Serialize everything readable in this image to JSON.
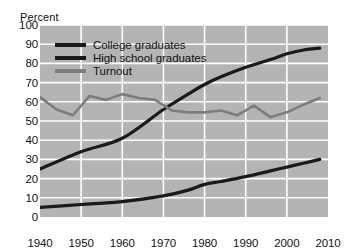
{
  "chart_data": {
    "type": "line",
    "title": "",
    "subtitle": "",
    "xlabel": "",
    "ylabel": "Percent",
    "xlim": [
      1940,
      2010
    ],
    "ylim": [
      0,
      100
    ],
    "grid": true,
    "legend_position": "upper-left-inside",
    "xticks": [
      1940,
      1950,
      1960,
      1970,
      1980,
      1990,
      2000,
      2010
    ],
    "yticks": [
      0,
      10,
      20,
      30,
      40,
      50,
      60,
      70,
      80,
      90,
      100
    ],
    "xtick_labels": [
      "1940",
      "1950",
      "1960",
      "1970",
      "1980",
      "1990",
      "2000",
      "2010"
    ],
    "ytick_labels": [
      "0",
      "10",
      "20",
      "30",
      "40",
      "50",
      "60",
      "70",
      "80",
      "90",
      "100"
    ],
    "plot_background": "#b4b4b4",
    "gridline_color": "#ffffff",
    "series": [
      {
        "name": "College graduates",
        "color": "#1a1a1a",
        "x": [
          1940,
          1950,
          1960,
          1970,
          1976,
          1980,
          1984,
          1990,
          1996,
          2000,
          2004,
          2008
        ],
        "values": [
          5,
          6.5,
          8,
          11,
          14,
          17,
          18.5,
          21,
          24,
          26,
          28,
          30
        ]
      },
      {
        "name": "High school graduates",
        "color": "#1a1a1a",
        "x": [
          1940,
          1950,
          1960,
          1970,
          1976,
          1980,
          1984,
          1990,
          1996,
          2000,
          2004,
          2008
        ],
        "values": [
          25,
          34,
          41,
          56,
          64,
          69,
          73,
          78,
          82,
          85,
          87,
          88
        ]
      },
      {
        "name": "Turnout",
        "color": "#7d7d7d",
        "x": [
          1940,
          1944,
          1948,
          1952,
          1956,
          1960,
          1964,
          1968,
          1972,
          1976,
          1980,
          1984,
          1988,
          1992,
          1996,
          2000,
          2004,
          2008
        ],
        "values": [
          62.5,
          56,
          53,
          63,
          61,
          64,
          62,
          61,
          55.5,
          54.5,
          54.5,
          55.5,
          53,
          58,
          52,
          54.5,
          58.5,
          62
        ]
      }
    ]
  },
  "legend": {
    "items": [
      {
        "label": "College graduates",
        "color": "#1a1a1a"
      },
      {
        "label": "High school graduates",
        "color": "#1a1a1a"
      },
      {
        "label": "Turnout",
        "color": "#7d7d7d"
      }
    ]
  }
}
